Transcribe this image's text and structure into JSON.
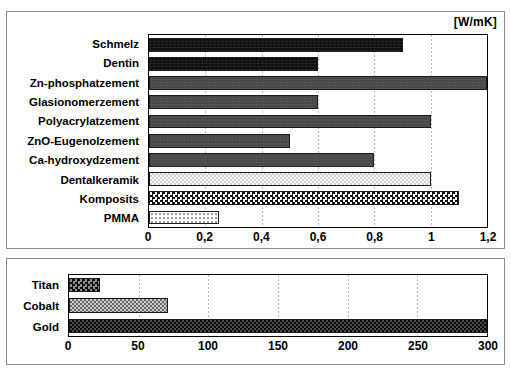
{
  "figure": {
    "unit_label": "[W/mK]"
  },
  "chart_data": [
    {
      "type": "bar",
      "orientation": "horizontal",
      "title": "",
      "xlabel": "[W/mK]",
      "ylabel": "",
      "xlim": [
        0,
        1.2
      ],
      "grid": true,
      "legend": "none",
      "tick_labels": [
        "0",
        "0,2",
        "0,4",
        "0,6",
        "0,8",
        "1",
        "1,2"
      ],
      "tick_values": [
        0,
        0.2,
        0.4,
        0.6,
        0.8,
        1.0,
        1.2
      ],
      "categories": [
        "Schmelz",
        "Dentin",
        "Zn-phosphatzement",
        "Glasionomerzement",
        "Polyacrylatzement",
        "ZnO-Eugenolzement",
        "Ca-hydroxydzement",
        "Dentalkeramik",
        "Komposits",
        "PMMA"
      ],
      "values": [
        0.9,
        0.6,
        1.2,
        0.6,
        1.0,
        0.5,
        0.8,
        1.0,
        1.1,
        0.25
      ],
      "fills": [
        "f-black",
        "f-black",
        "f-gray",
        "f-gray",
        "f-gray",
        "f-gray",
        "f-gray",
        "f-lightcheck",
        "f-checker",
        "f-dots"
      ]
    },
    {
      "type": "bar",
      "orientation": "horizontal",
      "title": "",
      "xlabel": "",
      "ylabel": "",
      "xlim": [
        0,
        300
      ],
      "grid": true,
      "legend": "none",
      "tick_labels": [
        "0",
        "50",
        "100",
        "150",
        "200",
        "250",
        "300"
      ],
      "tick_values": [
        0,
        50,
        100,
        150,
        200,
        250,
        300
      ],
      "categories": [
        "Titan",
        "Cobalt",
        "Gold"
      ],
      "values": [
        22,
        71,
        300
      ],
      "fills": [
        "f-darkcheck",
        "f-midcheck",
        "f-denseblack"
      ]
    }
  ]
}
